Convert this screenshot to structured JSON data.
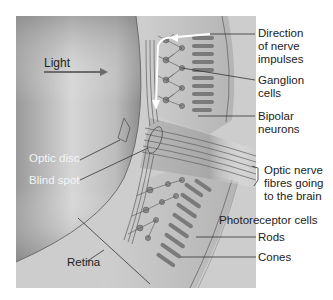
{
  "diagram": {
    "labels": {
      "light": "Light",
      "direction_line1": "Direction",
      "direction_line2": "of nerve",
      "direction_line3": "impulses",
      "ganglion_line1": "Ganglion",
      "ganglion_line2": "cells",
      "bipolar_line1": "Bipolar",
      "bipolar_line2": "neurons",
      "optic_disc": "Optic disc",
      "blind_spot": "Blind spot",
      "optic_nerve_line1": "Optic nerve",
      "optic_nerve_line2": "fibres going",
      "optic_nerve_line3": "to the brain",
      "photoreceptor_cells": "Photoreceptor cells",
      "rods": "Rods",
      "cones": "Cones",
      "retina": "Retina"
    },
    "colors": {
      "eye_interior_dark": "#8a8a8a",
      "eye_interior_light": "#d9d9d9",
      "retina_layer": "#bdbdbd",
      "fiber_line": "#5a5a5a",
      "arrow_white": "#ffffff",
      "leader_line": "#333333"
    }
  }
}
